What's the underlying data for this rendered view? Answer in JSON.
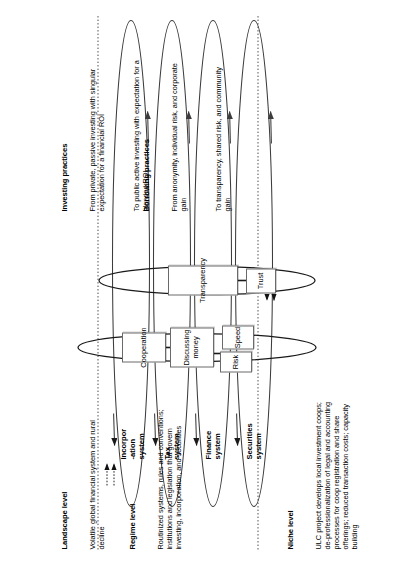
{
  "figure": {
    "type": "multi-level-perspective-diagram",
    "orientation": "rotated-90-ccw"
  },
  "levels": [
    {
      "id": "landscape",
      "title": "Landscape level",
      "body": "Volatile global financial system and rural decline"
    },
    {
      "id": "regime",
      "title": "Regime level",
      "body": "Routinized systems, rules and conventions; institutions and legislation that govern investing, incorporation, and securities"
    },
    {
      "id": "niche",
      "title": "Niche level",
      "body": "ULC project develops local investment coops; de-professionalization of legal and accounting processes for coop registration and share offerings; reduced transaction costs; capacity building"
    }
  ],
  "systems": [
    {
      "id": "securities",
      "label": "Securities\nsystem"
    },
    {
      "id": "finance",
      "label": "Finance\nsystem"
    },
    {
      "id": "tax",
      "label": "Tax\nsystem"
    },
    {
      "id": "incorporation",
      "label": "Incorpor\n-ation\nsystem"
    }
  ],
  "practices": [
    {
      "id": "investing",
      "title": "Investing practices",
      "from": "From private, passive investing with singular expectation for a financial ROI",
      "to": "To public active investing with expectation for a blended ROI",
      "nodes": [
        "Cooperation",
        "Discussing money",
        "Risk",
        "Speed"
      ]
    },
    {
      "id": "borrowing",
      "title": "Borrowing practices",
      "from": "From anonymity, individual risk, and corporate gain",
      "to": "To transparency, shared risk, and community gain",
      "nodes": [
        "Transparency",
        "Trust"
      ]
    }
  ],
  "nodes": [
    {
      "id": "cooperation",
      "label": "Cooperation"
    },
    {
      "id": "discussing-money",
      "label": "Discussing money"
    },
    {
      "id": "risk",
      "label": "Risk"
    },
    {
      "id": "speed",
      "label": "Speed"
    },
    {
      "id": "transparency",
      "label": "Transparency"
    },
    {
      "id": "trust",
      "label": "Trust"
    }
  ],
  "colors": {
    "stroke": "#3c3c3c",
    "box_border": "#6a6a6a",
    "divider": "#4a4a4a",
    "text": "#000000",
    "background": "#ffffff"
  }
}
